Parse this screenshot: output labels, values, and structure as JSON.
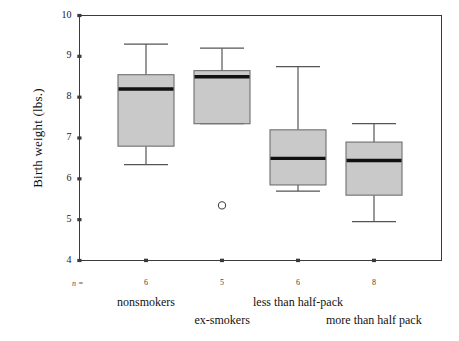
{
  "chart_data": {
    "type": "box",
    "title": "",
    "xlabel": "",
    "ylabel": "Birth weight (lbs.)",
    "ylim": [
      4,
      10
    ],
    "yticks": [
      4,
      5,
      6,
      7,
      8,
      9,
      10
    ],
    "ytick_labels": [
      "4",
      "5",
      "6",
      "7",
      "8",
      "9",
      "10"
    ],
    "grid": false,
    "legend": "none",
    "n_label": "n =",
    "categories": [
      "nonsmokers",
      "ex-smokers",
      "less than half-pack",
      "more than half pack"
    ],
    "counts": [
      6,
      5,
      6,
      8
    ],
    "boxes": [
      {
        "category": "nonsmokers",
        "n": 6,
        "whisker_low": 6.35,
        "q1": 6.8,
        "median": 8.2,
        "q3": 8.55,
        "whisker_high": 9.3,
        "outliers": []
      },
      {
        "category": "ex-smokers",
        "n": 5,
        "whisker_low": 7.35,
        "q1": 7.35,
        "median": 8.5,
        "q3": 8.65,
        "whisker_high": 9.2,
        "outliers": [
          5.35
        ]
      },
      {
        "category": "less than half-pack",
        "n": 6,
        "whisker_low": 5.7,
        "q1": 5.85,
        "median": 6.5,
        "q3": 7.2,
        "whisker_high": 8.75,
        "outliers": []
      },
      {
        "category": "more than half pack",
        "n": 8,
        "whisker_low": 4.95,
        "q1": 5.6,
        "median": 6.45,
        "q3": 6.9,
        "whisker_high": 7.35,
        "outliers": []
      }
    ],
    "colors": {
      "box_fill": "#c9c9c9",
      "box_edge": "#6e6e6e",
      "median": "#111111",
      "whisker": "#555555",
      "axis": "#3a3a3a",
      "background": "#ffffff"
    }
  },
  "axis": {
    "y_title": "Birth weight (lbs.)"
  }
}
